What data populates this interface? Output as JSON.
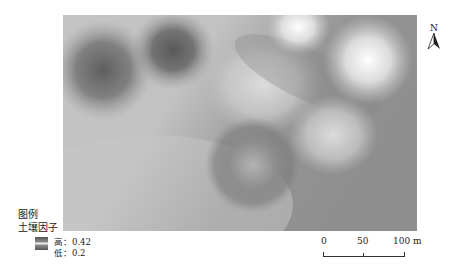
{
  "map": {
    "name": "soil-factor-interpolation",
    "value_range": {
      "high": 0.42,
      "low": 0.2
    },
    "colors": {
      "high": "#f5f5f5",
      "low": "#5a5a5a",
      "base": "#9c9c9c"
    }
  },
  "north_arrow": {
    "label": "N"
  },
  "legend": {
    "title": "图例",
    "layer": "土壤因子",
    "high_label": "高：0.42",
    "low_label": "低：0.2"
  },
  "scale_bar": {
    "ticks": [
      "0",
      "50",
      "100 m"
    ]
  }
}
